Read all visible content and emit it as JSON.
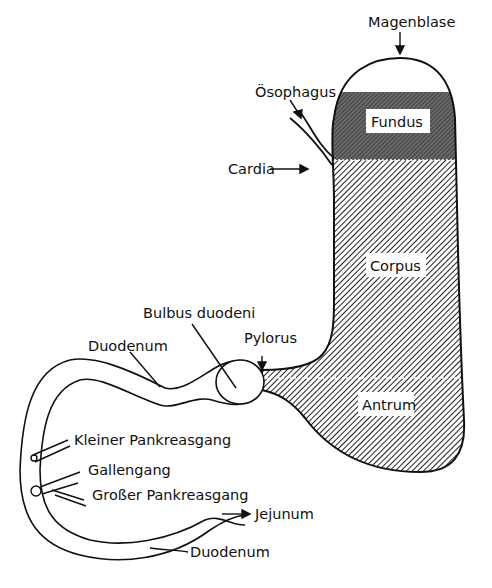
{
  "diagram": {
    "type": "anatomical-diagram",
    "colors": {
      "ink": "#111111",
      "fundus_fill": "#5a5a5a",
      "hatch": "#222222",
      "background": "#ffffff"
    },
    "labels": {
      "magenblase": "Magenblase",
      "oesophagus": "Ösophagus",
      "cardia": "Cardia",
      "fundus": "Fundus",
      "corpus": "Corpus",
      "antrum": "Antrum",
      "pylorus": "Pylorus",
      "bulbus_duodeni": "Bulbus duodeni",
      "duodenum_upper": "Duodenum",
      "duodenum_lower": "Duodenum",
      "kleiner_pankreasgang": "Kleiner Pankreasgang",
      "gallengang": "Gallengang",
      "grosser_pankreasgang": "Großer Pankreasgang",
      "jejunum": "Jejunum"
    }
  }
}
